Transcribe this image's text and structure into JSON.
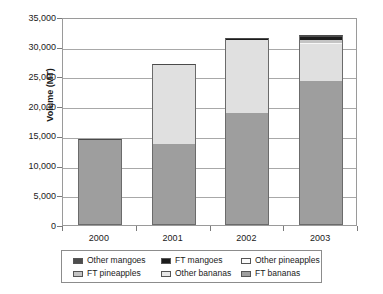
{
  "chart_data": {
    "type": "bar",
    "stacked": true,
    "title": "",
    "xlabel": "",
    "ylabel": "Volume (MT)",
    "categories": [
      "2000",
      "2001",
      "2002",
      "2003"
    ],
    "ylim": [
      0,
      35000
    ],
    "ytick_values": [
      0,
      5000,
      10000,
      15000,
      20000,
      25000,
      30000,
      35000
    ],
    "ytick_labels": [
      "0",
      "5,000",
      "10,000",
      "15,000",
      "20,000",
      "25,000",
      "30,000",
      "35,000"
    ],
    "grid": true,
    "legend_position": "bottom",
    "series": [
      {
        "name": "FT bananas",
        "color": "#9e9e9e",
        "values": [
          14500,
          13700,
          18800,
          24300
        ]
      },
      {
        "name": "Other bananas",
        "color": "#e0e0e0",
        "values": [
          0,
          13400,
          12300,
          6100
        ]
      },
      {
        "name": "Other pineapples",
        "color": "#f7f7f7",
        "values": [
          0,
          0,
          0,
          300
        ]
      },
      {
        "name": "FT pineapples",
        "color": "#c4c4c4",
        "values": [
          0,
          0,
          0,
          500
        ]
      },
      {
        "name": "FT mangoes",
        "color": "#1c1c1c",
        "values": [
          0,
          0,
          250,
          400
        ]
      },
      {
        "name": "Other mangoes",
        "color": "#4d4d4d",
        "values": [
          0,
          0,
          100,
          350
        ]
      }
    ],
    "legend_entries": [
      {
        "label": "Other mangoes",
        "color": "#4d4d4d"
      },
      {
        "label": "FT mangoes",
        "color": "#1c1c1c"
      },
      {
        "label": "Other pineapples",
        "color": "#fbfbfb"
      },
      {
        "label": "FT pineapples",
        "color": "#c4c4c4"
      },
      {
        "label": "Other bananas",
        "color": "#e8e8e8"
      },
      {
        "label": "FT bananas",
        "color": "#9e9e9e"
      }
    ]
  }
}
